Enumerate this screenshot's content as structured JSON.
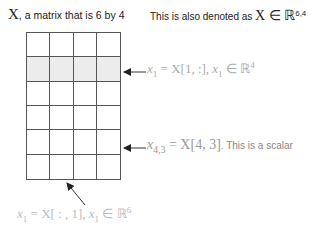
{
  "title": {
    "symbol": "X",
    "text": ", a matrix that is 6 by 4"
  },
  "denoted": {
    "text": "This is also denoted as ",
    "math": "X ∈ ℝ",
    "superscript": "6,4"
  },
  "matrix": {
    "rows": 6,
    "cols": 4,
    "highlighted_row": 1,
    "shade_color": "#ececec",
    "line_color": "#555555"
  },
  "annotations": {
    "row_vector": {
      "var": "x",
      "sub": "1",
      "expr": " = X[1, :], ",
      "var2": "x",
      "sub2": "1",
      "set": " ∈ ℝ",
      "sup": "4"
    },
    "scalar": {
      "var": "x",
      "sub": "4,3",
      "expr": " = X[4, 3]",
      "note": ". This is a scalar"
    },
    "column_vector": {
      "var": "x",
      "sub": "1",
      "expr": " = X[ : , 1], ",
      "var2": "x",
      "sub2": "1",
      "set": " ∈ ℝ",
      "sup": "6"
    }
  }
}
